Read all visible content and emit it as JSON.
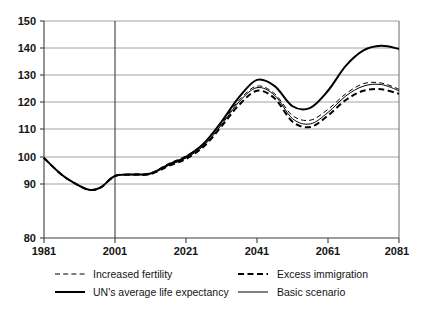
{
  "chart_data": {
    "type": "line",
    "title": "",
    "subtitle": "",
    "xlabel": "",
    "ylabel": "",
    "xlim": [
      1981,
      2081
    ],
    "ylim": [
      80,
      150
    ],
    "grid": true,
    "legend_position": "bottom",
    "x_ticks": [
      "1981",
      "2001",
      "2021",
      "2041",
      "2061",
      "2081"
    ],
    "x_tick_values": [
      1981,
      2001,
      2021,
      2041,
      2061,
      2081
    ],
    "y_ticks": [
      "80",
      "90",
      "100",
      "110",
      "120",
      "130",
      "140",
      "150"
    ],
    "y_tick_values": [
      80,
      90,
      100,
      110,
      120,
      130,
      140,
      150
    ],
    "x": [
      1981,
      1986,
      1991,
      1994,
      1997,
      2001,
      2006,
      2011,
      2016,
      2021,
      2026,
      2031,
      2036,
      2041,
      2046,
      2051,
      2056,
      2061,
      2066,
      2071,
      2076,
      2081
    ],
    "series": [
      {
        "name": "Increased fertility",
        "style": "thin-dashed",
        "values": [
          105.8,
          100.4,
          96.8,
          95.5,
          96.3,
          100.0,
          100.6,
          101.0,
          104.0,
          106.5,
          110.5,
          117.0,
          124.5,
          129.0,
          126.5,
          119.5,
          118.0,
          121.5,
          126.5,
          129.8,
          130.0,
          128.0
        ]
      },
      {
        "name": "Excess immigration",
        "style": "thick-dashed",
        "values": [
          105.8,
          100.4,
          96.8,
          95.5,
          96.3,
          100.0,
          100.4,
          100.6,
          103.2,
          105.5,
          109.5,
          116.0,
          123.0,
          127.5,
          125.0,
          117.5,
          115.8,
          119.5,
          124.5,
          127.5,
          128.0,
          126.5
        ]
      },
      {
        "name": "UN's average life expectancy",
        "style": "thick-solid",
        "values": [
          105.8,
          100.4,
          96.8,
          95.5,
          96.3,
          100.0,
          100.5,
          100.8,
          103.6,
          106.2,
          110.5,
          117.5,
          125.5,
          131.0,
          129.0,
          122.5,
          122.0,
          127.5,
          135.5,
          140.5,
          142.0,
          141.0
        ]
      },
      {
        "name": "Basic scenario",
        "style": "thin-solid",
        "values": [
          105.8,
          100.4,
          96.8,
          95.5,
          96.3,
          100.0,
          100.4,
          100.7,
          103.4,
          105.8,
          109.8,
          116.5,
          124.0,
          128.5,
          126.0,
          118.5,
          116.8,
          120.5,
          125.8,
          129.0,
          129.5,
          127.5
        ]
      }
    ]
  },
  "legend": {
    "entries": [
      {
        "label": "Increased fertility",
        "style": "thin-dashed"
      },
      {
        "label": "Excess immigration",
        "style": "thick-dashed"
      },
      {
        "label": "UN's average life expectancy",
        "style": "thick-solid"
      },
      {
        "label": "Basic scenario",
        "style": "thin-solid"
      }
    ]
  }
}
